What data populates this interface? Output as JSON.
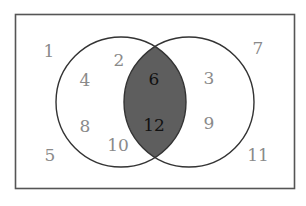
{
  "diagram": {
    "type": "venn",
    "universe": {
      "label": "universal-set",
      "rect": {
        "x": 15,
        "y": 14,
        "width": 280,
        "height": 175
      },
      "stroke": "#555555",
      "outside_values": [
        "1",
        "5",
        "7",
        "11"
      ]
    },
    "set_a": {
      "center": {
        "x": 121,
        "y": 102
      },
      "radius": 65,
      "only_values": [
        "2",
        "4",
        "8",
        "10"
      ]
    },
    "set_b": {
      "center": {
        "x": 189,
        "y": 102
      },
      "radius": 65,
      "only_values": [
        "3",
        "9"
      ]
    },
    "intersection": {
      "values": [
        "6",
        "12"
      ],
      "fill": "#5e5e5e"
    },
    "colors": {
      "outline": "#333333",
      "number_outer": "#8a8a8a",
      "number_intersection": "#111111",
      "shaded": "#5e5e5e"
    }
  },
  "labels": {
    "n1": "1",
    "n2": "2",
    "n3": "3",
    "n4": "4",
    "n5": "5",
    "n6": "6",
    "n7": "7",
    "n8": "8",
    "n9": "9",
    "n10": "10",
    "n11": "11",
    "n12": "12"
  }
}
